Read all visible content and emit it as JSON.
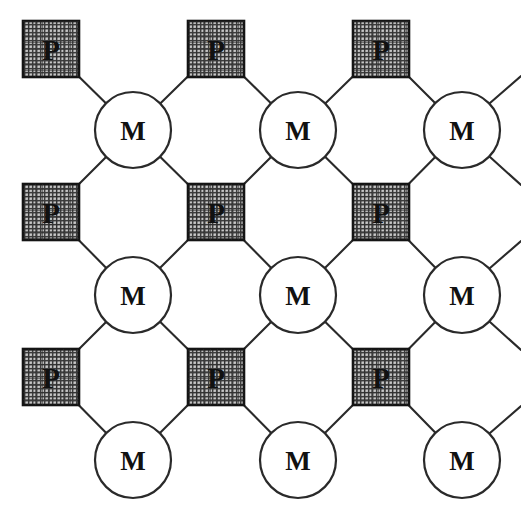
{
  "diagram": {
    "background_color": "#ffffff",
    "line_color": "#2a2a2a",
    "square_border_color": "#141414",
    "hatch_dark": "#3a3a3a",
    "hatch_light": "#dedede",
    "label_color": "#111111",
    "canvas": {
      "width": 521,
      "height": 515
    }
  },
  "legend": {
    "p_label": "P",
    "m_label": "M",
    "p_shape": "hatched-square",
    "m_shape": "open-circle"
  },
  "grid": {
    "p_columns_x": [
      51,
      216,
      381
    ],
    "p_rows_y": [
      49,
      212,
      377
    ],
    "m_columns_x": [
      133,
      298,
      462
    ],
    "m_rows_y": [
      130,
      295,
      460
    ],
    "p_size": 56,
    "m_radius": 38
  },
  "nodes": {
    "squares": [
      {
        "id": "p-r1c1",
        "label": "P",
        "cx": 51,
        "cy": 49,
        "size": 56
      },
      {
        "id": "p-r1c2",
        "label": "P",
        "cx": 216,
        "cy": 49,
        "size": 56
      },
      {
        "id": "p-r1c3",
        "label": "P",
        "cx": 381,
        "cy": 49,
        "size": 56
      },
      {
        "id": "p-r2c1",
        "label": "P",
        "cx": 51,
        "cy": 212,
        "size": 56
      },
      {
        "id": "p-r2c2",
        "label": "P",
        "cx": 216,
        "cy": 212,
        "size": 56
      },
      {
        "id": "p-r2c3",
        "label": "P",
        "cx": 381,
        "cy": 212,
        "size": 56
      },
      {
        "id": "p-r3c1",
        "label": "P",
        "cx": 51,
        "cy": 377,
        "size": 56
      },
      {
        "id": "p-r3c2",
        "label": "P",
        "cx": 216,
        "cy": 377,
        "size": 56
      },
      {
        "id": "p-r3c3",
        "label": "P",
        "cx": 381,
        "cy": 377,
        "size": 56
      }
    ],
    "circles": [
      {
        "id": "m-r1c1",
        "label": "M",
        "cx": 133,
        "cy": 130,
        "r": 38
      },
      {
        "id": "m-r1c2",
        "label": "M",
        "cx": 298,
        "cy": 130,
        "r": 38
      },
      {
        "id": "m-r1c3",
        "label": "M",
        "cx": 462,
        "cy": 130,
        "r": 38
      },
      {
        "id": "m-r2c1",
        "label": "M",
        "cx": 133,
        "cy": 295,
        "r": 38
      },
      {
        "id": "m-r2c2",
        "label": "M",
        "cx": 298,
        "cy": 295,
        "r": 38
      },
      {
        "id": "m-r2c3",
        "label": "M",
        "cx": 462,
        "cy": 295,
        "r": 38
      },
      {
        "id": "m-r3c1",
        "label": "M",
        "cx": 133,
        "cy": 460,
        "r": 38
      },
      {
        "id": "m-r3c2",
        "label": "M",
        "cx": 298,
        "cy": 460,
        "r": 38
      },
      {
        "id": "m-r3c3",
        "label": "M",
        "cx": 462,
        "cy": 460,
        "r": 38
      }
    ]
  },
  "bonds": [
    {
      "from": "p-r1c1",
      "to": "m-r1c1"
    },
    {
      "from": "p-r1c2",
      "to": "m-r1c1"
    },
    {
      "from": "p-r1c2",
      "to": "m-r1c2"
    },
    {
      "from": "p-r1c3",
      "to": "m-r1c2"
    },
    {
      "from": "p-r1c3",
      "to": "m-r1c3"
    },
    {
      "from": "p-r2c1",
      "to": "m-r1c1"
    },
    {
      "from": "p-r2c2",
      "to": "m-r1c1"
    },
    {
      "from": "p-r2c2",
      "to": "m-r1c2"
    },
    {
      "from": "p-r2c3",
      "to": "m-r1c2"
    },
    {
      "from": "p-r2c3",
      "to": "m-r1c3"
    },
    {
      "from": "p-r2c1",
      "to": "m-r2c1"
    },
    {
      "from": "p-r2c2",
      "to": "m-r2c1"
    },
    {
      "from": "p-r2c2",
      "to": "m-r2c2"
    },
    {
      "from": "p-r2c3",
      "to": "m-r2c2"
    },
    {
      "from": "p-r2c3",
      "to": "m-r2c3"
    },
    {
      "from": "p-r3c1",
      "to": "m-r2c1"
    },
    {
      "from": "p-r3c2",
      "to": "m-r2c1"
    },
    {
      "from": "p-r3c2",
      "to": "m-r2c2"
    },
    {
      "from": "p-r3c3",
      "to": "m-r2c2"
    },
    {
      "from": "p-r3c3",
      "to": "m-r2c3"
    },
    {
      "from": "p-r3c1",
      "to": "m-r3c1"
    },
    {
      "from": "p-r3c2",
      "to": "m-r3c1"
    },
    {
      "from": "p-r3c2",
      "to": "m-r3c2"
    },
    {
      "from": "p-r3c3",
      "to": "m-r3c2"
    },
    {
      "from": "p-r3c3",
      "to": "m-r3c3"
    }
  ],
  "edge_stubs": [
    {
      "id": "stub-m-r1c3-right",
      "x1": 490,
      "y1": 103,
      "x2": 521,
      "y2": 76
    },
    {
      "id": "stub-m-r1c3-rightdown",
      "x1": 490,
      "y1": 157,
      "x2": 521,
      "y2": 185
    },
    {
      "id": "stub-m-r2c3-right",
      "x1": 490,
      "y1": 268,
      "x2": 521,
      "y2": 241
    },
    {
      "id": "stub-m-r2c3-rightdown",
      "x1": 490,
      "y1": 322,
      "x2": 521,
      "y2": 350
    },
    {
      "id": "stub-m-r3c3-right",
      "x1": 490,
      "y1": 433,
      "x2": 521,
      "y2": 406
    }
  ]
}
